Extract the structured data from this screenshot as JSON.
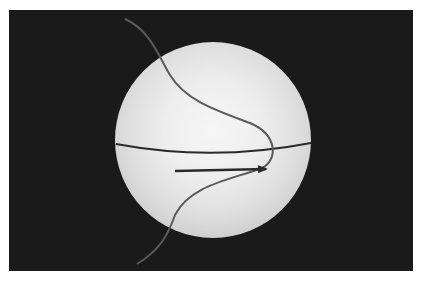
{
  "diagram": {
    "background_color": "#1a1a1a",
    "sphere": {
      "cx": 213,
      "cy": 140,
      "r": 98,
      "highlight": "#f6f6f6",
      "shade": "#c8c8c8"
    },
    "equator": {
      "color": "#2a2a2a"
    },
    "curve": {
      "color": "#555555"
    },
    "arrow": {
      "color": "#2a2a2a",
      "direction": "right"
    }
  }
}
